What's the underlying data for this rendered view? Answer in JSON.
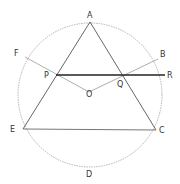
{
  "diagram": {
    "type": "geometry-circle-triangle",
    "circle": {
      "cx": 90,
      "cy": 95,
      "r": 72,
      "style": "dashed"
    },
    "points": {
      "A": {
        "label": "A",
        "x": 90,
        "y": 22,
        "lx": 87,
        "ly": 18
      },
      "F": {
        "label": "F",
        "x": 25,
        "y": 57,
        "lx": 14,
        "ly": 56
      },
      "B": {
        "label": "B",
        "x": 158,
        "y": 59,
        "lx": 161,
        "ly": 56
      },
      "P": {
        "label": "P",
        "x": 56,
        "y": 75,
        "lx": 44,
        "ly": 78
      },
      "Q": {
        "label": "Q",
        "x": 124,
        "y": 75,
        "lx": 118,
        "ly": 87
      },
      "R": {
        "label": "R",
        "x": 165,
        "y": 75,
        "lx": 168,
        "ly": 78
      },
      "O": {
        "label": "O",
        "x": 89,
        "y": 92,
        "lx": 86,
        "ly": 96
      },
      "E": {
        "label": "E",
        "x": 23,
        "y": 129,
        "lx": 11,
        "ly": 132
      },
      "C": {
        "label": "C",
        "x": 156,
        "y": 130,
        "lx": 160,
        "ly": 133
      },
      "D": {
        "label": "D",
        "x": 89,
        "y": 168,
        "lx": 86,
        "ly": 177
      }
    },
    "colors": {
      "solid": "#444444",
      "thick": "#222222",
      "circle": "#aaaaaa",
      "radius": "#999999"
    }
  }
}
